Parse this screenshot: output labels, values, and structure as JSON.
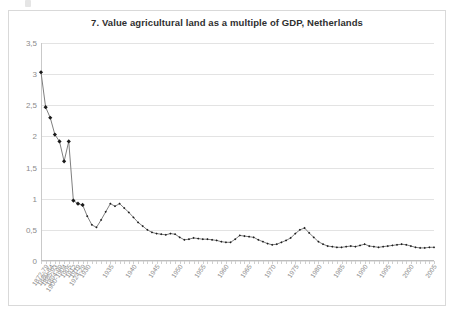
{
  "chart": {
    "title": "7. Value agricultural land as a multiple of GDP, Netherlands"
  },
  "chart_data": {
    "type": "line",
    "title": "7. Value agricultural land as a multiple of GDP, Netherlands",
    "xlabel": "",
    "ylabel": "",
    "ylim": [
      0,
      3.5
    ],
    "yticks": [
      0,
      0.5,
      1,
      1.5,
      2,
      2.5,
      3,
      3.5
    ],
    "ytick_labels": [
      "0",
      "0,5",
      "1",
      "1,5",
      "2",
      "2,5",
      "3",
      "3,5"
    ],
    "grid": true,
    "legend": false,
    "markers": "diamond",
    "line_color": "#7f7f7f",
    "marker_color": "#1a1a1a",
    "xtick_labels": [
      "1872-79",
      "1880-84",
      "1885-93",
      "1894-99",
      "1900-1904",
      "1905",
      "1912",
      "1919",
      "1924-29",
      "1930",
      "1935",
      "1940",
      "1945",
      "1950",
      "1955",
      "1960",
      "1965",
      "1970",
      "1975",
      "1980",
      "1985",
      "1990",
      "1995",
      "2000",
      "2005"
    ],
    "x": [
      "1872-79",
      "1880-84",
      "1885-93",
      "1894-99",
      "1900-1904",
      "1905",
      "1912",
      "1919",
      "1924-29",
      "1930",
      "1931",
      "1932",
      "1933",
      "1934",
      "1935",
      "1936",
      "1937",
      "1938",
      "1939",
      "1940",
      "1941",
      "1942",
      "1943",
      "1944",
      "1945",
      "1946",
      "1947",
      "1948",
      "1949",
      "1950",
      "1951",
      "1952",
      "1953",
      "1954",
      "1955",
      "1956",
      "1957",
      "1958",
      "1959",
      "1960",
      "1961",
      "1962",
      "1963",
      "1964",
      "1965",
      "1966",
      "1967",
      "1968",
      "1969",
      "1970",
      "1971",
      "1972",
      "1973",
      "1974",
      "1975",
      "1976",
      "1977",
      "1978",
      "1979",
      "1980",
      "1981",
      "1982",
      "1983",
      "1984",
      "1985",
      "1986",
      "1987",
      "1988",
      "1989",
      "1990",
      "1991",
      "1992",
      "1993",
      "1994",
      "1995",
      "1996",
      "1997",
      "1998",
      "1999",
      "2000",
      "2001",
      "2002",
      "2003",
      "2004",
      "2005",
      "2006"
    ],
    "values": [
      3.03,
      2.47,
      2.3,
      2.03,
      1.92,
      1.6,
      1.92,
      0.97,
      0.92,
      0.9,
      0.72,
      0.58,
      0.54,
      0.66,
      0.79,
      0.92,
      0.88,
      0.92,
      0.85,
      0.78,
      0.7,
      0.62,
      0.56,
      0.5,
      0.46,
      0.44,
      0.43,
      0.42,
      0.44,
      0.43,
      0.38,
      0.34,
      0.35,
      0.37,
      0.36,
      0.35,
      0.35,
      0.34,
      0.33,
      0.31,
      0.3,
      0.3,
      0.35,
      0.41,
      0.4,
      0.39,
      0.38,
      0.34,
      0.31,
      0.28,
      0.26,
      0.27,
      0.3,
      0.33,
      0.37,
      0.44,
      0.5,
      0.53,
      0.45,
      0.38,
      0.31,
      0.27,
      0.24,
      0.23,
      0.22,
      0.22,
      0.23,
      0.24,
      0.23,
      0.25,
      0.27,
      0.24,
      0.23,
      0.22,
      0.23,
      0.24,
      0.25,
      0.26,
      0.27,
      0.26,
      0.24,
      0.22,
      0.21,
      0.21,
      0.22,
      0.22
    ],
    "marker_indices": [
      0,
      1,
      2,
      3,
      4,
      5,
      6,
      7,
      8,
      9
    ]
  }
}
